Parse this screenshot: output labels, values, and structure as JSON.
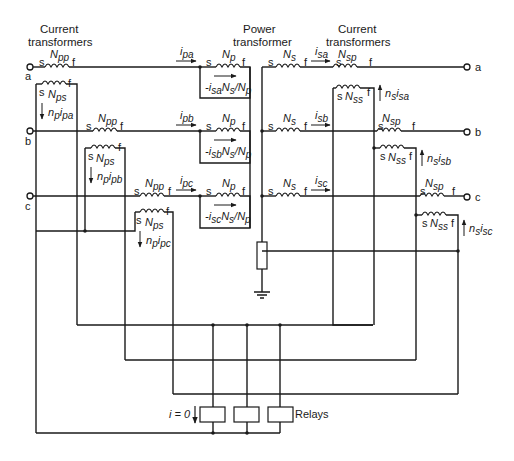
{
  "headers": {
    "ct_left_line1": "Current",
    "ct_left_line2": "transformers",
    "power_line1": "Power",
    "power_line2": "transformer",
    "ct_right_line1": "Current",
    "ct_right_line2": "transformers"
  },
  "terminals": {
    "left": [
      "a",
      "b",
      "c"
    ],
    "right": [
      "a",
      "b",
      "c"
    ]
  },
  "winding_end_labels": {
    "start": "s",
    "finish": "f"
  },
  "windings": {
    "Npp": {
      "main": "N",
      "sub": "pp"
    },
    "Nps": {
      "main": "N",
      "sub": "ps"
    },
    "Np": {
      "main": "N",
      "sub": "p"
    },
    "Ns": {
      "main": "N",
      "sub": "s"
    },
    "Nsp": {
      "main": "N",
      "sub": "sp"
    },
    "Nss": {
      "main": "N",
      "sub": "ss"
    }
  },
  "currents": {
    "i_pa": {
      "main": "i",
      "sub": "pa"
    },
    "i_pb": {
      "main": "i",
      "sub": "pb"
    },
    "i_pc": {
      "main": "i",
      "sub": "pc"
    },
    "i_sa": {
      "main": "i",
      "sub": "sa"
    },
    "i_sb": {
      "main": "i",
      "sub": "sb"
    },
    "i_sc": {
      "main": "i",
      "sub": "sc"
    }
  },
  "ct_primary_currents": [
    {
      "n": "n",
      "nsub": "p",
      "i": "i",
      "isub": "pa"
    },
    {
      "n": "n",
      "nsub": "p",
      "i": "i",
      "isub": "pb"
    },
    {
      "n": "n",
      "nsub": "p",
      "i": "i",
      "isub": "pc"
    }
  ],
  "ct_secondary_currents": [
    {
      "n": "n",
      "nsub": "s",
      "i": "i",
      "isub": "sa"
    },
    {
      "n": "n",
      "nsub": "s",
      "i": "i",
      "isub": "sb"
    },
    {
      "n": "n",
      "nsub": "s",
      "i": "i",
      "isub": "sc"
    }
  ],
  "reflected_currents": [
    {
      "prefix": "-",
      "i": "i",
      "isub": "sa",
      "n1": "N",
      "n1sub": "s",
      "slash": "/",
      "n2": "N",
      "n2sub": "p"
    },
    {
      "prefix": "-",
      "i": "i",
      "isub": "sb",
      "n1": "N",
      "n1sub": "s",
      "slash": "/",
      "n2": "N",
      "n2sub": "p"
    },
    {
      "prefix": "-",
      "i": "i",
      "isub": "sc",
      "n1": "N",
      "n1sub": "s",
      "slash": "/",
      "n2": "N",
      "n2sub": "p"
    }
  ],
  "relays": {
    "label": "Relays",
    "zero_current_label": "i = 0",
    "count": 3
  }
}
